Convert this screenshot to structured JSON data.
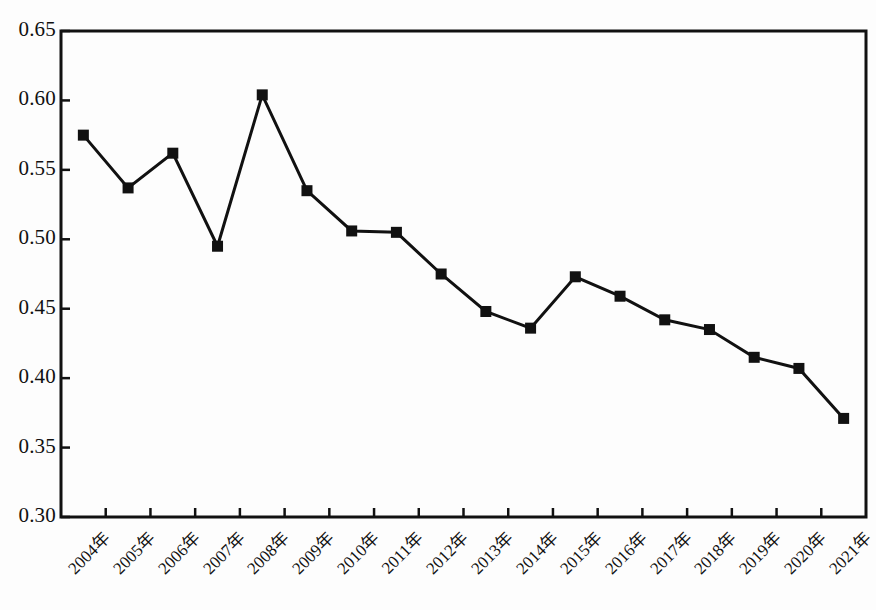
{
  "chart_data": {
    "type": "line",
    "title": "",
    "subtitle": "",
    "xlabel": "",
    "ylabel": "",
    "categories": [
      "2004年",
      "2005年",
      "2006年",
      "2007年",
      "2008年",
      "2009年",
      "2010年",
      "2011年",
      "2012年",
      "2013年",
      "2014年",
      "2015年",
      "2016年",
      "2017年",
      "2018年",
      "2019年",
      "2020年",
      "2021年"
    ],
    "values": [
      0.575,
      0.537,
      0.562,
      0.495,
      0.604,
      0.535,
      0.506,
      0.505,
      0.475,
      0.448,
      0.436,
      0.473,
      0.459,
      0.442,
      0.435,
      0.415,
      0.407,
      0.371
    ],
    "series": [
      {
        "name": "",
        "values": [
          0.575,
          0.537,
          0.562,
          0.495,
          0.604,
          0.535,
          0.506,
          0.505,
          0.475,
          0.448,
          0.436,
          0.473,
          0.459,
          0.442,
          0.435,
          0.415,
          0.407,
          0.371
        ]
      }
    ],
    "ylim": [
      0.3,
      0.65
    ],
    "ytick_values": [
      0.3,
      0.35,
      0.4,
      0.45,
      0.5,
      0.55,
      0.6,
      0.65
    ],
    "ytick_labels": [
      "0.30",
      "0.35",
      "0.40",
      "0.45",
      "0.50",
      "0.55",
      "0.60",
      "0.65"
    ],
    "xtick_labels": [
      "2004年",
      "2005年",
      "2006年",
      "2007年",
      "2008年",
      "2009年",
      "2010年",
      "2011年",
      "2012年",
      "2013年",
      "2014年",
      "2015年",
      "2016年",
      "2017年",
      "2018年",
      "2019年",
      "2020年",
      "2021年"
    ],
    "xtick_rotation": -45,
    "grid": false,
    "legend": null,
    "legend_position": "none",
    "line_color": "#111111",
    "line_width": 3,
    "marker": "square",
    "marker_size": 11,
    "marker_color": "#111111",
    "annotations": []
  },
  "figure": {
    "background_color": "#fdfdfd",
    "axis_color": "#111111",
    "frame": "box"
  }
}
